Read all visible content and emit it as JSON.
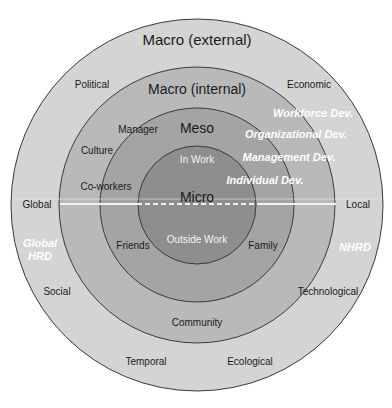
{
  "diagram": {
    "colors": {
      "background": "#ffffff",
      "macro_external": "#d4d4d4",
      "macro_internal": "#b9b9b9",
      "meso": "#a4a4a4",
      "micro": "#8e8e8e",
      "stroke": "#3a3a3a",
      "divider": "#f2f2f2"
    },
    "rings": {
      "macro_external": {
        "title": "Macro (external)",
        "factors": [
          "Political",
          "Economic",
          "Social",
          "Technological",
          "Temporal",
          "Ecological"
        ]
      },
      "macro_internal": {
        "title": "Macro (internal)",
        "factors": [
          "Culture",
          "Community"
        ]
      },
      "meso": {
        "title": "Meso",
        "factors": [
          "Manager",
          "Co-workers",
          "Friends",
          "Family"
        ]
      },
      "micro": {
        "title": "Micro",
        "halves": [
          "In Work",
          "Outside Work"
        ]
      }
    },
    "axis": {
      "left": "Global",
      "right": "Local"
    },
    "side_labels": {
      "left": [
        "Global",
        "HRD"
      ],
      "right": "NHRD"
    },
    "development_levels": [
      "Workforce Dev.",
      "Organizational Dev.",
      "Management Dev.",
      "Individual Dev."
    ]
  }
}
